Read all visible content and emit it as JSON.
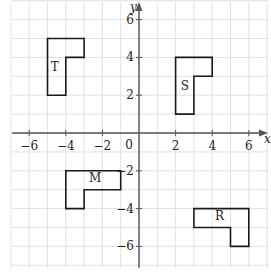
{
  "chart_data": {
    "type": "diagram",
    "title": "",
    "xlabel": "x",
    "ylabel": "y",
    "xlim": [
      -7,
      7
    ],
    "ylim": [
      -7,
      7
    ],
    "grid": true,
    "x_ticks": [
      -6,
      -4,
      -2,
      2,
      4,
      6
    ],
    "y_ticks": [
      -6,
      -4,
      -2,
      2,
      4,
      6
    ],
    "origin_label": "0",
    "shapes": [
      {
        "label": "T",
        "vertices": [
          [
            -5,
            5
          ],
          [
            -3,
            5
          ],
          [
            -3,
            4
          ],
          [
            -4,
            4
          ],
          [
            -4,
            2
          ],
          [
            -5,
            2
          ]
        ],
        "label_pos": [
          -4.6,
          3.3
        ]
      },
      {
        "label": "S",
        "vertices": [
          [
            2,
            4
          ],
          [
            4,
            4
          ],
          [
            4,
            3
          ],
          [
            3,
            3
          ],
          [
            3,
            1
          ],
          [
            2,
            1
          ]
        ],
        "label_pos": [
          2.5,
          2.3
        ]
      },
      {
        "label": "M",
        "vertices": [
          [
            -4,
            -2
          ],
          [
            -1,
            -2
          ],
          [
            -1,
            -3
          ],
          [
            -3,
            -3
          ],
          [
            -3,
            -4
          ],
          [
            -4,
            -4
          ]
        ],
        "label_pos": [
          -2.4,
          -2.6
        ]
      },
      {
        "label": "R",
        "vertices": [
          [
            3,
            -4
          ],
          [
            6,
            -4
          ],
          [
            6,
            -6
          ],
          [
            5,
            -6
          ],
          [
            5,
            -5
          ],
          [
            3,
            -5
          ]
        ],
        "label_pos": [
          4.4,
          -4.6
        ]
      }
    ]
  },
  "colors": {
    "grid": "#d9d9d9",
    "axis": "#555555",
    "shape": "#1a1a1a",
    "text": "#222222"
  }
}
